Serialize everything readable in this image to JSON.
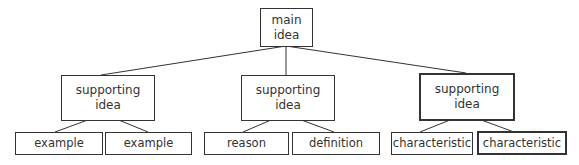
{
  "root": {
    "label": "main idea",
    "lines": [
      "main",
      "idea"
    ]
  },
  "supporting": [
    {
      "lines": [
        "supporting",
        "idea"
      ],
      "children": [
        "example",
        "example"
      ]
    },
    {
      "lines": [
        "supporting",
        "idea"
      ],
      "children": [
        "reason",
        "definition"
      ]
    },
    {
      "lines": [
        "supporting",
        "idea"
      ],
      "children": [
        "characteristic",
        "characteristic"
      ],
      "emphasized": true
    }
  ],
  "colors": {
    "stroke": "#333333",
    "text": "#333333",
    "background": "#ffffff"
  }
}
